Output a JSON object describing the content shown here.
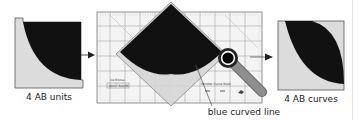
{
  "diagram": {
    "steps": [
      {
        "id": "input",
        "label": "4 AB units"
      },
      {
        "id": "process",
        "label": "blue curved line"
      },
      {
        "id": "output",
        "label": "4 AB curves"
      }
    ],
    "ruler": {
      "logo_text": "Ice Bonus",
      "sub_text": "QUILT RULER",
      "corner_text": "Wonder Curve Ruler"
    },
    "arrows": [
      "input-to-process",
      "process-to-output"
    ],
    "colors": {
      "fabric_dark": "#111111",
      "fabric_light": "#dcdcdc",
      "ruler_bg": "#f4f4f4",
      "ruler_lines": "#9a9a9a",
      "cutter_handle": "#8e8e8e",
      "outline": "#555555",
      "arrow": "#222222"
    }
  }
}
